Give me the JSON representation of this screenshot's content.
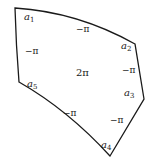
{
  "diagram": {
    "type": "pentagon-with-angle-labels",
    "stroke_color": "#1a1a1a",
    "background": "#ffffff",
    "vertices": [
      {
        "id": "a1",
        "base": "a",
        "sub": "1"
      },
      {
        "id": "a2",
        "base": "a",
        "sub": "2"
      },
      {
        "id": "a3",
        "base": "a",
        "sub": "3"
      },
      {
        "id": "a4",
        "base": "a",
        "sub": "4"
      },
      {
        "id": "a5",
        "base": "a",
        "sub": "5"
      }
    ],
    "edge_labels": {
      "a1_a2": "−π",
      "a2_a3": "−π",
      "a3_a4": "−π",
      "a4_a5": "−π",
      "a5_a1": "−π"
    },
    "center_label": "2π"
  }
}
